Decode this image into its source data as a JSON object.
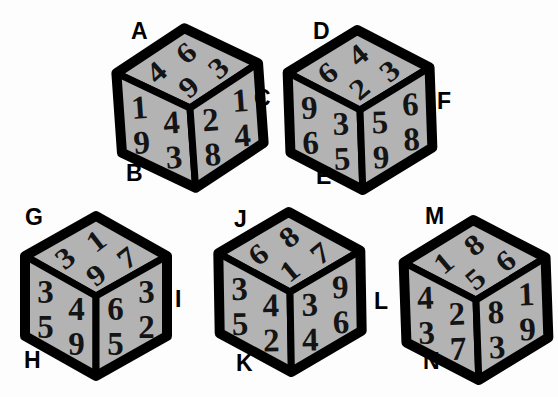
{
  "colors": {
    "background": "#fdfdfd",
    "cube_face": "#b3b3b3",
    "cube_edge": "#000000",
    "digit": "#141414",
    "label": "#000000"
  },
  "cubes": [
    {
      "name": "cube-ABC",
      "labels": {
        "top": "A",
        "bottom": "B",
        "right": "C"
      },
      "top": [
        "6",
        "3",
        "4",
        "9"
      ],
      "left": [
        "1",
        "4",
        "9",
        "3"
      ],
      "right": [
        "2",
        "1",
        "8",
        "4"
      ]
    },
    {
      "name": "cube-DEF",
      "labels": {
        "top": "D",
        "bottom": "E",
        "right": "F"
      },
      "top": [
        "4",
        "3",
        "6",
        "2"
      ],
      "left": [
        "9",
        "3",
        "6",
        "5"
      ],
      "right": [
        "5",
        "6",
        "9",
        "8"
      ]
    },
    {
      "name": "cube-GHI",
      "labels": {
        "top": "G",
        "bottom": "H",
        "right": "I"
      },
      "top": [
        "1",
        "7",
        "3",
        "9"
      ],
      "left": [
        "3",
        "4",
        "5",
        "9"
      ],
      "right": [
        "6",
        "3",
        "5",
        "2"
      ]
    },
    {
      "name": "cube-JKL",
      "labels": {
        "top": "J",
        "bottom": "K",
        "right": "L"
      },
      "top": [
        "8",
        "7",
        "6",
        "1"
      ],
      "left": [
        "3",
        "4",
        "5",
        "2"
      ],
      "right": [
        "3",
        "9",
        "4",
        "6"
      ]
    },
    {
      "name": "cube-MN",
      "labels": {
        "top": "M",
        "bottom": "N"
      },
      "top": [
        "8",
        "6",
        "1",
        "5"
      ],
      "left": [
        "4",
        "2",
        "3",
        "7"
      ],
      "right": [
        "8",
        "1",
        "3",
        "9"
      ]
    }
  ]
}
